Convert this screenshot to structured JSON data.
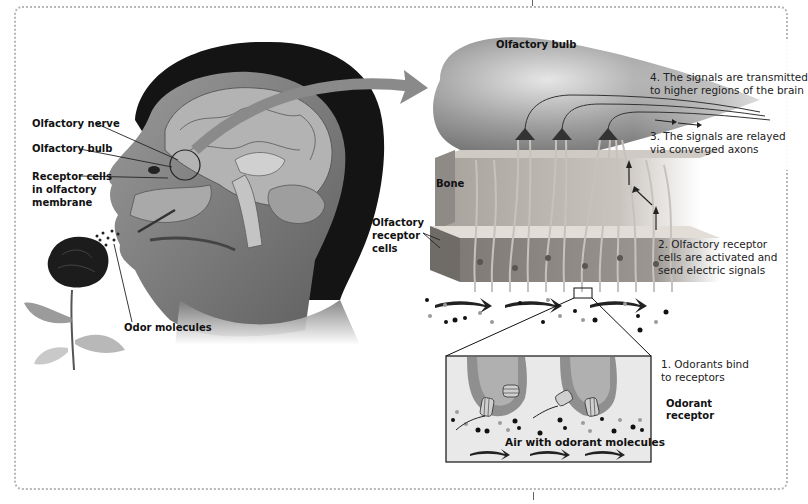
{
  "diagram": {
    "type": "anatomical-process",
    "topic": "Olfaction (sense of smell)",
    "left_panel": {
      "labels": {
        "olfactory_nerve": "Olfactory nerve",
        "olfactory_bulb": "Olfactory bulb",
        "receptor_cells_1": "Receptor cells",
        "receptor_cells_2": "in olfactory",
        "receptor_cells_3": "membrane",
        "odor_molecules": "Odor molecules"
      }
    },
    "right_panel": {
      "labels": {
        "olfactory_bulb": "Olfactory bulb",
        "bone": "Bone",
        "olfactory_receptor_cells_1": "Olfactory",
        "olfactory_receptor_cells_2": "receptor",
        "olfactory_receptor_cells_3": "cells",
        "odorant_receptor_1": "Odorant",
        "odorant_receptor_2": "receptor",
        "air_with_odorant": "Air with odorant molecules"
      },
      "steps": [
        {
          "line1": "1. Odorants bind",
          "line2": "to receptors"
        },
        {
          "line1": "2. Olfactory receptor",
          "line2": "cells are activated and",
          "line3": "send electric signals"
        },
        {
          "line1": "3. The signals are relayed",
          "line2": "via converged axons"
        },
        {
          "line1": "4. The signals are transmitted",
          "line2": "to higher regions of the brain"
        }
      ]
    },
    "colors": {
      "hair": "#141414",
      "skin": "#8c8c8c",
      "bulb": "#9a9a9a",
      "bone": "#b9b4ae",
      "tissue": "#8e8a86",
      "arrow": "#7d7d7d",
      "frame": "#b7b7b7"
    }
  }
}
